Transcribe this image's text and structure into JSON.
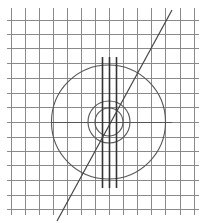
{
  "canvas": {
    "width": 205,
    "height": 223,
    "background": "#ffffff"
  },
  "colors": {
    "grid": "#8a8a8a",
    "axis": "#555555",
    "shape": "#555555",
    "bars": "#333333",
    "diagonal": "#444444"
  },
  "grid": {
    "vertical_x": [
      11,
      25,
      39,
      53,
      67,
      81,
      95,
      109,
      123,
      137,
      151,
      165,
      180,
      194
    ],
    "vertical_y_range": [
      8,
      215
    ],
    "horizontal_y": [
      20,
      34,
      48,
      63,
      78,
      93,
      107,
      122,
      137,
      151,
      165,
      180,
      195,
      209
    ],
    "horizontal_x_range": [
      7,
      199
    ]
  },
  "center_line": {
    "x1": 52,
    "x2": 172,
    "y": 122
  },
  "circles": [
    {
      "name": "large-circle",
      "cx": 108.5,
      "cy": 122,
      "r": 57
    },
    {
      "name": "middle-circle",
      "cx": 109,
      "cy": 122,
      "r": 21
    },
    {
      "name": "inner-circle",
      "cx": 109,
      "cy": 122,
      "r": 14
    }
  ],
  "vertical_bars": [
    {
      "x": 102,
      "y1": 57,
      "y2": 188
    },
    {
      "x": 109,
      "y1": 57,
      "y2": 188
    },
    {
      "x": 116,
      "y1": 57,
      "y2": 188
    }
  ],
  "diagonal": {
    "x1": 57,
    "y1": 221,
    "x2": 172,
    "y2": 10
  }
}
